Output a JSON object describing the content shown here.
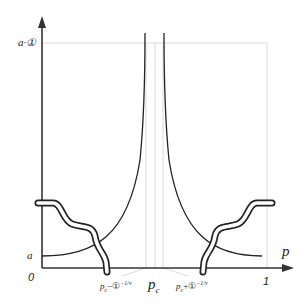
{
  "diagram": {
    "type": "function-plot-schematic",
    "axes": {
      "x_label": "p",
      "y_label_top": "a·①",
      "y_label_low": "a",
      "origin_label": "0",
      "x_end_label": "1"
    },
    "x_ticks": [
      {
        "label": "p_c − ①^{−1/ν}",
        "display_main": "p",
        "display_sub": "c",
        "display_rest": "−①",
        "display_sup": "−1/ν"
      },
      {
        "label": "p_c",
        "display_main": "p",
        "display_sub": "c"
      },
      {
        "label": "p_c + ①^{−1/ν}",
        "display_main": "p",
        "display_sub": "c",
        "display_rest": "+①",
        "display_sup": "−1/ν"
      }
    ],
    "curves": [
      {
        "name": "left-divergent-curve",
        "description": "rises from a at p=0 to infinity near p_c"
      },
      {
        "name": "right-divergent-curve",
        "description": "descends from infinity near p_c to a at p=1"
      },
      {
        "name": "left-wavy-band",
        "description": "double wavy line descending from upper left to x-axis at p_c − ①^{−1/ν}"
      },
      {
        "name": "right-wavy-band",
        "description": "double wavy line ascending from x-axis at p_c + ①^{−1/ν} to upper right"
      }
    ],
    "colors": {
      "curve": "#222222",
      "guide": "#cccccc",
      "axis": "#333333"
    }
  }
}
